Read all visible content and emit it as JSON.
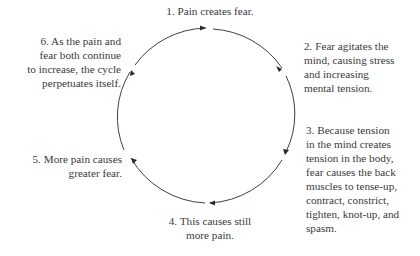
{
  "diagram": {
    "type": "cycle",
    "steps": [
      {
        "id": 1,
        "lines": [
          "1. Pain creates fear."
        ]
      },
      {
        "id": 2,
        "lines": [
          "2. Fear agitates the",
          "mind, causing stress",
          "and increasing",
          "mental tension."
        ]
      },
      {
        "id": 3,
        "lines": [
          "3. Because tension",
          "in the mind creates",
          "tension in the body,",
          "fear causes the back",
          "muscles to tense-up,",
          "contract, constrict,",
          "tighten, knot-up, and",
          "spasm."
        ]
      },
      {
        "id": 4,
        "lines": [
          "4. This causes still",
          "more pain."
        ]
      },
      {
        "id": 5,
        "lines": [
          "5. More pain causes",
          "greater fear."
        ]
      },
      {
        "id": 6,
        "lines": [
          "6. As the pain and",
          "fear both continue",
          "to increase, the cycle",
          "perpetuates itself."
        ]
      }
    ],
    "colors": {
      "text": "#3a3a3a",
      "stroke": "#2a2a2a"
    }
  }
}
